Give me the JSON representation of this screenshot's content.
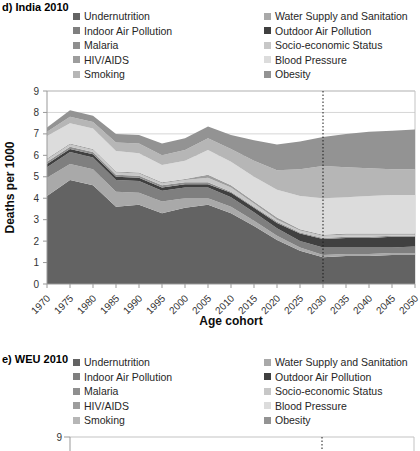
{
  "panels": [
    {
      "id": "d",
      "title": "d) India 2010",
      "ylabel": "Deaths per 1000",
      "xlabel": "Age cohort"
    },
    {
      "id": "e",
      "title": "e) WEU 2010",
      "visible_top_tick": "9"
    }
  ],
  "legend": {
    "columns": [
      [
        {
          "label": "Undernutrition",
          "color": "#636363"
        },
        {
          "label": "Indoor Air Pollution",
          "color": "#7f7f7f"
        },
        {
          "label": "Malaria",
          "color": "#8f8f8f"
        },
        {
          "label": "HIV/AIDS",
          "color": "#9d9d9d"
        },
        {
          "label": "Smoking",
          "color": "#b6b6b6"
        }
      ],
      [
        {
          "label": "Water Supply and Sanitation",
          "color": "#a9a9a9"
        },
        {
          "label": "Outdoor Air Pollution",
          "color": "#404040"
        },
        {
          "label": "Socio-economic Status",
          "color": "#c7c7c7"
        },
        {
          "label": "Blood Pressure",
          "color": "#dcdcdc"
        },
        {
          "label": "Obesity",
          "color": "#939393"
        }
      ]
    ]
  },
  "chart_data": [
    {
      "type": "area",
      "stacked": true,
      "title": "d) India 2010",
      "xlabel": "Age cohort",
      "ylabel": "Deaths per 1000",
      "ylim": [
        0,
        9
      ],
      "y_ticks": [
        0,
        1,
        2,
        3,
        4,
        5,
        6,
        7,
        8,
        9
      ],
      "grid": "horizontal",
      "legend_position": "top-two-columns",
      "reference_line": {
        "category": 2030,
        "style": "dotted-vertical"
      },
      "categories": [
        1970,
        1975,
        1980,
        1985,
        1990,
        1995,
        2000,
        2005,
        2010,
        2015,
        2020,
        2025,
        2030,
        2035,
        2040,
        2045,
        2050
      ],
      "series": [
        {
          "name": "Undernutrition",
          "color": "#636363",
          "values": [
            4.1,
            4.85,
            4.6,
            3.6,
            3.7,
            3.3,
            3.55,
            3.7,
            3.3,
            2.7,
            2.05,
            1.55,
            1.25,
            1.3,
            1.3,
            1.35,
            1.35
          ]
        },
        {
          "name": "Water Supply and Sanitation",
          "color": "#a9a9a9",
          "values": [
            0.85,
            0.75,
            0.75,
            0.7,
            0.55,
            0.55,
            0.45,
            0.3,
            0.3,
            0.25,
            0.2,
            0.15,
            0.1,
            0.1,
            0.1,
            0.1,
            0.1
          ]
        },
        {
          "name": "Indoor Air Pollution",
          "color": "#7f7f7f",
          "values": [
            0.5,
            0.55,
            0.55,
            0.55,
            0.55,
            0.5,
            0.5,
            0.5,
            0.45,
            0.4,
            0.35,
            0.3,
            0.35,
            0.3,
            0.3,
            0.25,
            0.3
          ]
        },
        {
          "name": "Outdoor Air Pollution",
          "color": "#404040",
          "values": [
            0.15,
            0.15,
            0.15,
            0.15,
            0.15,
            0.15,
            0.15,
            0.15,
            0.2,
            0.2,
            0.25,
            0.35,
            0.4,
            0.45,
            0.45,
            0.5,
            0.45
          ]
        },
        {
          "name": "Malaria",
          "color": "#8f8f8f",
          "values": [
            0.1,
            0.1,
            0.1,
            0.1,
            0.1,
            0.1,
            0.1,
            0.1,
            0.05,
            0.05,
            0.05,
            0.05,
            0.05,
            0.05,
            0.05,
            0.05,
            0.05
          ]
        },
        {
          "name": "Socio-economic Status",
          "color": "#c7c7c7",
          "values": [
            0.1,
            0.1,
            0.1,
            0.1,
            0.1,
            0.1,
            0.1,
            0.2,
            0.2,
            0.15,
            0.1,
            0.1,
            0.1,
            0.1,
            0.1,
            0.05,
            0.05
          ]
        },
        {
          "name": "HIV/AIDS",
          "color": "#9d9d9d",
          "values": [
            0.05,
            0.05,
            0.05,
            0.05,
            0.05,
            0.05,
            0.05,
            0.15,
            0.1,
            0.1,
            0.1,
            0.05,
            0.05,
            0.05,
            0.05,
            0.05,
            0.05
          ]
        },
        {
          "name": "Blood Pressure",
          "color": "#dcdcdc",
          "values": [
            1.05,
            0.95,
            0.95,
            0.95,
            0.9,
            0.8,
            0.85,
            1.15,
            1.1,
            1.15,
            1.3,
            1.55,
            1.7,
            1.7,
            1.75,
            1.8,
            1.8
          ]
        },
        {
          "name": "Smoking",
          "color": "#b6b6b6",
          "values": [
            0.2,
            0.3,
            0.3,
            0.4,
            0.45,
            0.45,
            0.5,
            0.55,
            0.6,
            0.75,
            0.9,
            1.25,
            1.5,
            1.4,
            1.3,
            1.2,
            1.2
          ]
        },
        {
          "name": "Obesity",
          "color": "#939393",
          "values": [
            0.2,
            0.3,
            0.3,
            0.4,
            0.4,
            0.55,
            0.55,
            0.55,
            0.65,
            0.95,
            1.2,
            1.3,
            1.35,
            1.55,
            1.7,
            1.8,
            1.85
          ]
        }
      ]
    },
    {
      "type": "area",
      "stacked": true,
      "title": "e) WEU 2010",
      "ylim": [
        0,
        9
      ],
      "visible_portion": "top frame edge, y tick 9 and dotted reference line only (cropped)",
      "reference_line": {
        "category": 2030,
        "style": "dotted-vertical"
      }
    }
  ]
}
